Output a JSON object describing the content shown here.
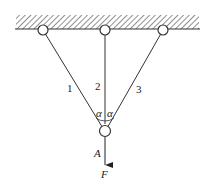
{
  "diagram": {
    "bars": [
      {
        "label": "1"
      },
      {
        "label": "2"
      },
      {
        "label": "3"
      }
    ],
    "angle_symbol": "α",
    "node_label": "A",
    "force_label": "F",
    "colors": {
      "line": "#333333",
      "background": "#ffffff"
    }
  }
}
